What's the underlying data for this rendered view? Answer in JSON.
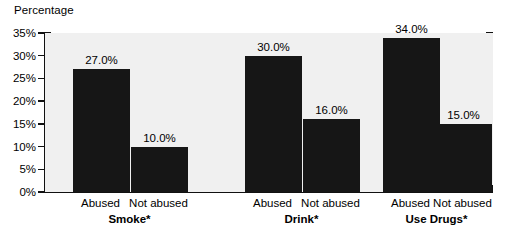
{
  "chart_data": {
    "type": "bar",
    "title": "Percentage",
    "xlabel": "",
    "ylabel": "Percentage",
    "grid": false,
    "legend": "none",
    "ylim": [
      0,
      35
    ],
    "ytick_labels": [
      "0%",
      "5%",
      "10%",
      "15%",
      "20%",
      "25%",
      "30%",
      "35%"
    ],
    "ytick_values": [
      0,
      5,
      10,
      15,
      20,
      25,
      30,
      35
    ],
    "categories": [
      "Abused",
      "Not abused"
    ],
    "groups": [
      {
        "label": "Smoke*",
        "bars": [
          {
            "category": "Abused",
            "value": 27.0,
            "data_label": "27.0%"
          },
          {
            "category": "Not abused",
            "value": 10.0,
            "data_label": "10.0%"
          }
        ]
      },
      {
        "label": "Drink*",
        "bars": [
          {
            "category": "Abused",
            "value": 30.0,
            "data_label": "30.0%"
          },
          {
            "category": "Not abused",
            "value": 16.0,
            "data_label": "16.0%"
          }
        ]
      },
      {
        "label": "Use Drugs*",
        "bars": [
          {
            "category": "Abused",
            "value": 34.0,
            "data_label": "34.0%"
          },
          {
            "category": "Not abused",
            "value": 15.0,
            "data_label": "15.0%"
          }
        ]
      }
    ],
    "colors": {
      "bar": "#161616",
      "plot_background": "#f0f0f0",
      "page_background": "#ffffff",
      "axis": "#111111",
      "text": "#000000"
    }
  }
}
